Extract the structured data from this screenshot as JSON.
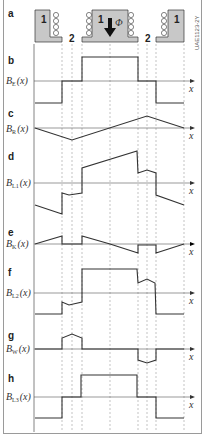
{
  "figure": {
    "code": "UAE1123-2Y",
    "colors": {
      "iron": "#c8c8c8",
      "line": "#333333",
      "axis": "#555555",
      "dash": "#999999",
      "border": "#9a9a9a"
    }
  },
  "panel_a": {
    "label": "a",
    "pole_labels": [
      "1",
      "1",
      "1"
    ],
    "gap_labels": [
      "2",
      "2"
    ],
    "flux_symbol": "Φ",
    "flux_arrow": "down-arrow"
  },
  "panels": [
    {
      "id": "b",
      "label": "b",
      "ylabel_main": "B",
      "ylabel_sub": "E",
      "ylabel_arg": "(x)",
      "xlabel": "x"
    },
    {
      "id": "c",
      "label": "c",
      "ylabel_main": "B",
      "ylabel_sub": "R",
      "ylabel_arg": "(x)",
      "xlabel": "x"
    },
    {
      "id": "d",
      "label": "d",
      "ylabel_main": "B",
      "ylabel_sub": "L1",
      "ylabel_arg": "(x)",
      "xlabel": "x"
    },
    {
      "id": "e",
      "label": "e",
      "ylabel_main": "B",
      "ylabel_sub": "K",
      "ylabel_arg": "(x)",
      "xlabel": "x"
    },
    {
      "id": "f",
      "label": "f",
      "ylabel_main": "B",
      "ylabel_sub": "L2",
      "ylabel_arg": "(x)",
      "xlabel": "x"
    },
    {
      "id": "g",
      "label": "g",
      "ylabel_main": "B",
      "ylabel_sub": "W",
      "ylabel_arg": "(x)",
      "xlabel": "x"
    },
    {
      "id": "h",
      "label": "h",
      "ylabel_main": "B",
      "ylabel_sub": "L3",
      "ylabel_arg": "(x)",
      "xlabel": "x"
    }
  ]
}
